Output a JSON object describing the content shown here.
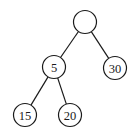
{
  "diagram": {
    "type": "binary-tree",
    "node_radius": 11.5,
    "stroke_color": "#1a1a1a",
    "background": "#ffffff",
    "nodes": [
      {
        "id": "root",
        "label": "",
        "x": 85,
        "y": 22
      },
      {
        "id": "n5",
        "label": "5",
        "x": 54,
        "y": 67
      },
      {
        "id": "n30",
        "label": "30",
        "x": 115,
        "y": 68
      },
      {
        "id": "n15",
        "label": "15",
        "x": 25,
        "y": 115
      },
      {
        "id": "n20",
        "label": "20",
        "x": 70,
        "y": 115
      }
    ],
    "edges": [
      {
        "from": "root",
        "to": "n5"
      },
      {
        "from": "root",
        "to": "n30"
      },
      {
        "from": "n5",
        "to": "n15"
      },
      {
        "from": "n5",
        "to": "n20"
      }
    ]
  }
}
